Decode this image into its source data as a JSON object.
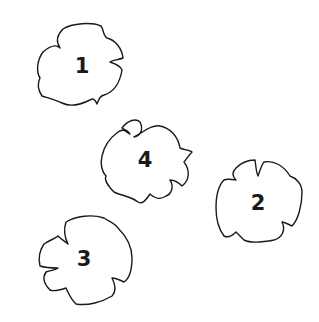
{
  "diagram": {
    "background": "#ffffff",
    "stroke_color": "#1a1a1a",
    "shapes": [
      {
        "label": "1",
        "cx": 82,
        "cy": 66
      },
      {
        "label": "2",
        "cx": 258,
        "cy": 203
      },
      {
        "label": "3",
        "cx": 84,
        "cy": 259
      },
      {
        "label": "4",
        "cx": 145,
        "cy": 160
      }
    ]
  }
}
